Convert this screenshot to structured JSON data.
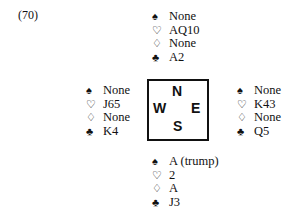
{
  "problem_label": "(70)",
  "suits": {
    "spades": "♠",
    "hearts": "♡",
    "diamonds": "♢",
    "clubs": "♣"
  },
  "compass": {
    "north": "N",
    "west": "W",
    "east": "E",
    "south": "S"
  },
  "hands": {
    "north": {
      "spades": "None",
      "hearts": "AQ10",
      "diamonds": "None",
      "clubs": "A2"
    },
    "west": {
      "spades": "None",
      "hearts": "J65",
      "diamonds": "None",
      "clubs": "K4"
    },
    "east": {
      "spades": "None",
      "hearts": "K43",
      "diamonds": "None",
      "clubs": "Q5"
    },
    "south": {
      "spades": "A (trump)",
      "hearts": "2",
      "diamonds": "A",
      "clubs": "J3"
    }
  }
}
